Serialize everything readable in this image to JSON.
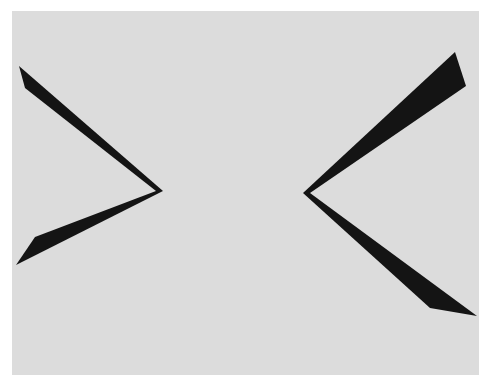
{
  "figure": {
    "colors": {
      "page_background": "#ffffff",
      "panel_background": "#dcdcdc",
      "shape_fill": "#141414"
    },
    "shapes": [
      {
        "name": "left-chevron",
        "direction": "points-right"
      },
      {
        "name": "right-chevron",
        "direction": "points-left"
      }
    ]
  }
}
